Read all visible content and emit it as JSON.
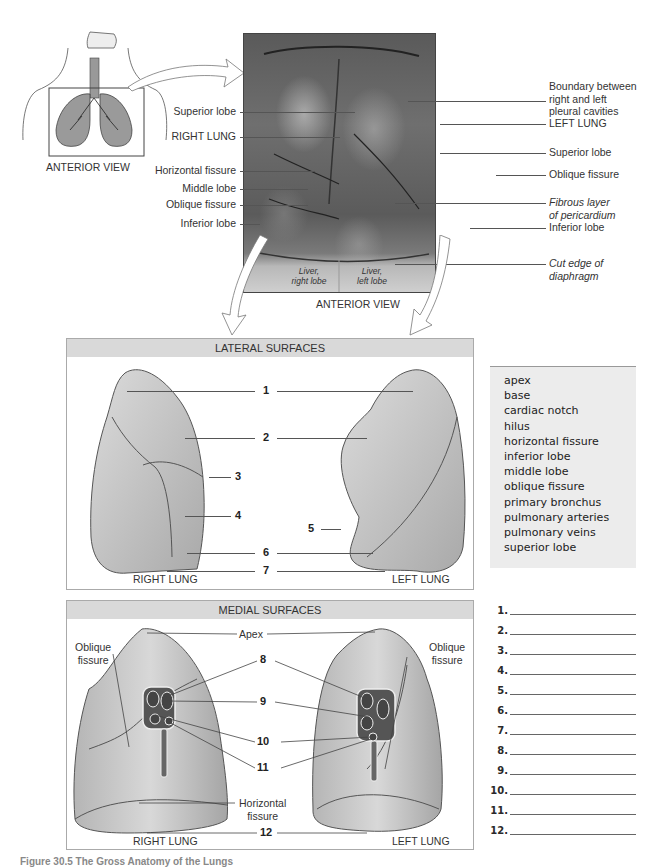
{
  "top": {
    "diagram_caption": "ANTERIOR VIEW",
    "photo_caption": "ANTERIOR VIEW",
    "left_labels": [
      "Superior lobe",
      "RIGHT LUNG",
      "Horizontal fissure",
      "Middle lobe",
      "Oblique fissure",
      "Inferior lobe"
    ],
    "right_labels": {
      "boundary": [
        "Boundary between",
        "right and left",
        "pleural cavities"
      ],
      "left_lung": "LEFT LUNG",
      "superior_lobe": "Superior lobe",
      "oblique_fissure": "Oblique fissure",
      "fibrous": [
        "Fibrous layer",
        "of pericardium"
      ],
      "inferior_lobe": "Inferior lobe",
      "cut_edge": [
        "Cut edge of",
        "diaphragm"
      ]
    },
    "liver_right": [
      "Liver,",
      "right lobe"
    ],
    "liver_left": [
      "Liver,",
      "left lobe"
    ]
  },
  "lateral": {
    "title": "LATERAL SURFACES",
    "numbers": [
      "1",
      "2",
      "3",
      "4",
      "5",
      "6",
      "7"
    ],
    "right_caption": "RIGHT LUNG",
    "left_caption": "LEFT LUNG"
  },
  "medial": {
    "title": "MEDIAL SURFACES",
    "apex": "Apex",
    "oblique_left": [
      "Oblique",
      "fissure"
    ],
    "oblique_right": [
      "Oblique",
      "fissure"
    ],
    "horizontal": [
      "Horizontal",
      "fissure"
    ],
    "numbers": [
      "8",
      "9",
      "10",
      "11",
      "12"
    ],
    "right_caption": "RIGHT LUNG",
    "left_caption": "LEFT LUNG"
  },
  "word_bank": [
    "apex",
    "base",
    "cardiac notch",
    "hilus",
    "horizontal fissure",
    "inferior lobe",
    "middle lobe",
    "oblique fissure",
    "primary bronchus",
    "pulmonary arteries",
    "pulmonary veins",
    "superior lobe"
  ],
  "answers": [
    "1.",
    "2.",
    "3.",
    "4.",
    "5.",
    "6.",
    "7.",
    "8.",
    "9.",
    "10.",
    "11.",
    "12."
  ],
  "caption": "Figure 30.5 The Gross Anatomy of the Lungs"
}
